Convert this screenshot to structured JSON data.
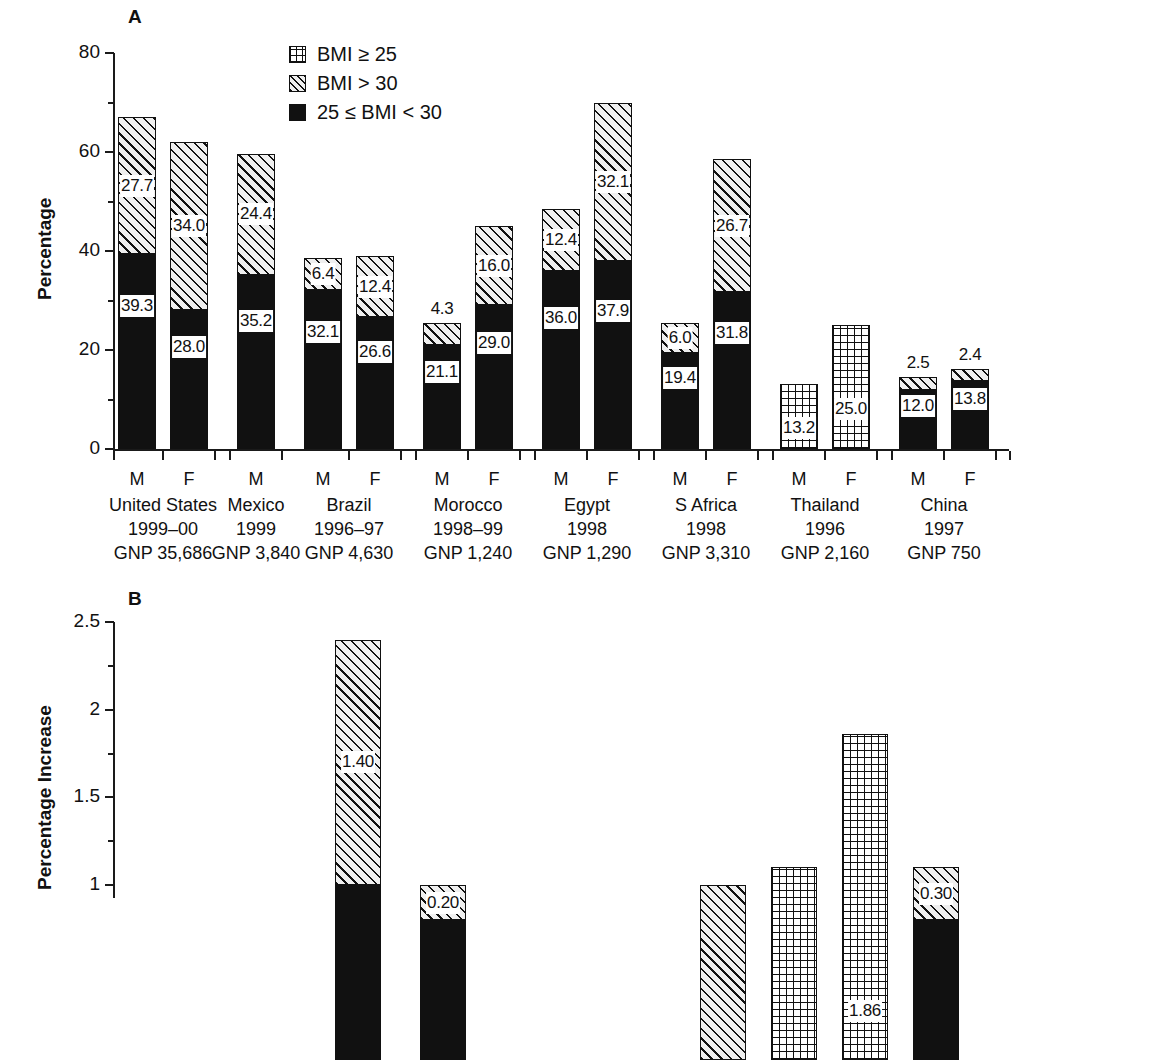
{
  "figure": {
    "panels": [
      {
        "letter": "A"
      },
      {
        "letter": "B"
      }
    ]
  },
  "legend": {
    "items": [
      {
        "pattern": "grid",
        "label": "BMI ≥ 25",
        "icon": "grid-swatch-icon"
      },
      {
        "pattern": "hatch",
        "label": "BMI > 30",
        "icon": "hatch-swatch-icon"
      },
      {
        "pattern": "solid",
        "label": "25 ≤ BMI < 30",
        "icon": "solid-swatch-icon"
      }
    ]
  },
  "chart_data": [
    {
      "type": "bar",
      "panel": "A",
      "title": "A",
      "xlabel": "",
      "ylabel": "Percentage",
      "ylim": [
        0,
        80
      ],
      "yticks": [
        "0",
        "20",
        "40",
        "60",
        "80"
      ],
      "grid": false,
      "legend_position": "top-center",
      "stacked": true,
      "series": [
        {
          "name": "25 ≤ BMI < 30",
          "pattern": "solid"
        },
        {
          "name": "BMI > 30",
          "pattern": "hatch"
        },
        {
          "name": "BMI ≥ 25",
          "pattern": "grid"
        }
      ],
      "countries": [
        {
          "name": "United States",
          "year": "1999–00",
          "gnp": "GNP 35,686"
        },
        {
          "name": "Mexico",
          "year": "1999",
          "gnp": "GNP 3,840"
        },
        {
          "name": "Brazil",
          "year": "1996–97",
          "gnp": "GNP 4,630"
        },
        {
          "name": "Morocco",
          "year": "1998–99",
          "gnp": "GNP 1,240"
        },
        {
          "name": "Egypt",
          "year": "1998",
          "gnp": "GNP 1,290"
        },
        {
          "name": "S Africa",
          "year": "1998",
          "gnp": "GNP 3,310"
        },
        {
          "name": "Thailand",
          "year": "1996",
          "gnp": "GNP 2,160"
        },
        {
          "name": "China",
          "year": "1997",
          "gnp": "GNP 750"
        }
      ],
      "bars": [
        {
          "country": "United States",
          "sex": "M",
          "overweight": 39.3,
          "overweight_label": "39.3",
          "obese": 27.7,
          "obese_label": "27.7",
          "obese_label_inside": true,
          "total": 67.0
        },
        {
          "country": "United States",
          "sex": "F",
          "overweight": 28.0,
          "overweight_label": "28.0",
          "obese": 34.0,
          "obese_label": "34.0",
          "obese_label_inside": true,
          "total": 62.0
        },
        {
          "country": "Mexico",
          "sex": "M",
          "overweight": 35.2,
          "overweight_label": "35.2",
          "obese": 24.4,
          "obese_label": "24.4",
          "obese_label_inside": true,
          "total": 59.6
        },
        {
          "country": "Brazil",
          "sex": "M",
          "overweight": 32.1,
          "overweight_label": "32.1",
          "obese": 6.4,
          "obese_label": "6.4",
          "obese_label_inside": true,
          "total": 38.5
        },
        {
          "country": "Brazil",
          "sex": "F",
          "overweight": 26.6,
          "overweight_label": "26.6",
          "obese": 12.4,
          "obese_label": "12.4",
          "obese_label_inside": true,
          "total": 39.0
        },
        {
          "country": "Morocco",
          "sex": "M",
          "overweight": 21.1,
          "overweight_label": "21.1",
          "obese": 4.3,
          "obese_label": "4.3",
          "obese_label_inside": false,
          "total": 25.4
        },
        {
          "country": "Morocco",
          "sex": "F",
          "overweight": 29.0,
          "overweight_label": "29.0",
          "obese": 16.0,
          "obese_label": "16.0",
          "obese_label_inside": true,
          "total": 45.0
        },
        {
          "country": "Egypt",
          "sex": "M",
          "overweight": 36.0,
          "overweight_label": "36.0",
          "obese": 12.4,
          "obese_label": "12.4",
          "obese_label_inside": true,
          "total": 48.4
        },
        {
          "country": "Egypt",
          "sex": "F",
          "overweight": 37.9,
          "overweight_label": "37.9",
          "obese": 32.1,
          "obese_label": "32.1",
          "obese_label_inside": true,
          "total": 70.0
        },
        {
          "country": "S Africa",
          "sex": "M",
          "overweight": 19.4,
          "overweight_label": "19.4",
          "obese": 6.0,
          "obese_label": "6.0",
          "obese_label_inside": true,
          "total": 25.4
        },
        {
          "country": "S Africa",
          "sex": "F",
          "overweight": 31.8,
          "overweight_label": "31.8",
          "obese": 26.7,
          "obese_label": "26.7",
          "obese_label_inside": true,
          "total": 58.5
        },
        {
          "country": "Thailand",
          "sex": "M",
          "combined": 13.2,
          "combined_label": "13.2",
          "total": 13.2
        },
        {
          "country": "Thailand",
          "sex": "F",
          "combined": 25.0,
          "combined_label": "25.0",
          "total": 25.0
        },
        {
          "country": "China",
          "sex": "M",
          "overweight": 12.0,
          "overweight_label": "12.0",
          "obese": 2.5,
          "obese_label": "2.5",
          "obese_label_inside": false,
          "total": 14.5
        },
        {
          "country": "China",
          "sex": "F",
          "overweight": 13.8,
          "overweight_label": "13.8",
          "obese": 2.4,
          "obese_label": "2.4",
          "obese_label_inside": false,
          "total": 16.2
        }
      ]
    },
    {
      "type": "bar",
      "panel": "B",
      "title": "B",
      "xlabel": "",
      "ylabel": "Percentage Increase",
      "ylim": [
        0,
        2.5
      ],
      "yticks": [
        "1",
        "1.5",
        "2",
        "2.5"
      ],
      "grid": false,
      "stacked": true,
      "note": "Panel B is cropped at the bottom of the screenshot; only bars above ~0.75 are visible.",
      "bars": [
        {
          "index": 3,
          "solid": 1.0,
          "hatch": 1.4,
          "hatch_label": "1.40",
          "total": 2.4
        },
        {
          "index": 4,
          "solid": 0.8,
          "hatch": 0.2,
          "hatch_label": "0.20",
          "total": 1.0
        },
        {
          "index": 9,
          "hatch": 1.0,
          "total": 1.0
        },
        {
          "index": 10,
          "grid": 1.1,
          "total": 1.1
        },
        {
          "index": 11,
          "grid": 1.86,
          "grid_label": "1.86",
          "total": 1.86
        },
        {
          "index": 12,
          "solid": 0.8,
          "hatch": 0.3,
          "hatch_label": "0.30",
          "total": 1.1
        }
      ]
    }
  ]
}
